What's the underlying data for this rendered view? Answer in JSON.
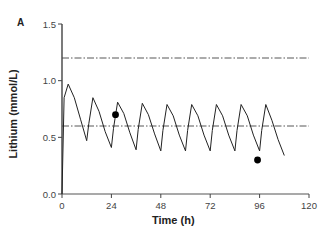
{
  "chart_data": {
    "type": "line",
    "panel_label": "A",
    "title": "",
    "xlabel": "Time (h)",
    "ylabel": "Lithium (mmol/L)",
    "xlim": [
      0,
      120
    ],
    "ylim": [
      0.0,
      1.5
    ],
    "xticks": [
      0,
      24,
      48,
      72,
      96,
      120
    ],
    "xtick_labels": [
      "0",
      "24",
      "48",
      "72",
      "96",
      "120"
    ],
    "yticks": [
      0.0,
      0.5,
      1.0,
      1.5
    ],
    "ytick_labels": [
      "0.0",
      "0.5",
      "1.0",
      "1.5"
    ],
    "grid": false,
    "reference_lines": [
      {
        "y": 1.2,
        "style": "dash-dot",
        "xrange": [
          0,
          120
        ]
      },
      {
        "y": 0.6,
        "style": "dash-dot",
        "xrange": [
          0,
          120
        ]
      }
    ],
    "series": [
      {
        "name": "Simulated concentration",
        "style": "line",
        "x": [
          0,
          1,
          3,
          6,
          9,
          12,
          13,
          15,
          18,
          21,
          24,
          25,
          27,
          30,
          33,
          36,
          37,
          39,
          42,
          45,
          48,
          49,
          51,
          54,
          57,
          60,
          61,
          63,
          66,
          69,
          72,
          73,
          75,
          78,
          81,
          84,
          85,
          87,
          90,
          93,
          96,
          97,
          99,
          102,
          105,
          108
        ],
        "y": [
          0.0,
          0.85,
          0.97,
          0.85,
          0.66,
          0.47,
          0.62,
          0.85,
          0.73,
          0.55,
          0.41,
          0.58,
          0.81,
          0.71,
          0.54,
          0.39,
          0.57,
          0.8,
          0.7,
          0.53,
          0.38,
          0.56,
          0.79,
          0.69,
          0.52,
          0.38,
          0.56,
          0.79,
          0.69,
          0.52,
          0.38,
          0.56,
          0.79,
          0.69,
          0.52,
          0.38,
          0.56,
          0.79,
          0.69,
          0.52,
          0.38,
          0.56,
          0.79,
          0.65,
          0.48,
          0.34
        ]
      },
      {
        "name": "Observed",
        "style": "scatter",
        "x": [
          26,
          95
        ],
        "y": [
          0.7,
          0.3
        ]
      }
    ],
    "legend": null
  }
}
